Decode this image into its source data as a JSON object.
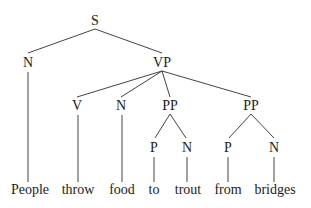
{
  "diagram": {
    "type": "parse-tree",
    "colors": {
      "text": "#222222",
      "edge": "#444444",
      "background": "#ffffff"
    },
    "nodes": {
      "s": {
        "label": "S",
        "x": 95,
        "y": 25
      },
      "n1": {
        "label": "N",
        "x": 28,
        "y": 67
      },
      "vp": {
        "label": "VP",
        "x": 162,
        "y": 67
      },
      "v": {
        "label": "V",
        "x": 77,
        "y": 110
      },
      "n2": {
        "label": "N",
        "x": 121,
        "y": 110
      },
      "pp1": {
        "label": "PP",
        "x": 170,
        "y": 110
      },
      "pp2": {
        "label": "PP",
        "x": 251,
        "y": 110
      },
      "p1": {
        "label": "P",
        "x": 154,
        "y": 152
      },
      "n3": {
        "label": "N",
        "x": 187,
        "y": 152
      },
      "p2": {
        "label": "P",
        "x": 228,
        "y": 152
      },
      "n4": {
        "label": "N",
        "x": 274,
        "y": 152
      }
    },
    "words": [
      {
        "text": "People",
        "x": 30
      },
      {
        "text": "throw",
        "x": 78
      },
      {
        "text": "food",
        "x": 122
      },
      {
        "text": "to",
        "x": 154
      },
      {
        "text": "trout",
        "x": 188
      },
      {
        "text": "from",
        "x": 228
      },
      {
        "text": "bridges",
        "x": 275
      }
    ],
    "word_baseline": 194
  }
}
